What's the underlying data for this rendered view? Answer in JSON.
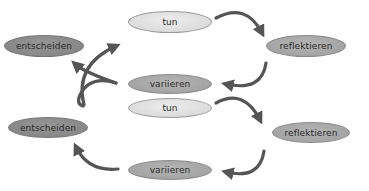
{
  "diagram": {
    "type": "cycle",
    "colors": {
      "light_node": "#dcdcdc",
      "mid_node": "#a4a4a4",
      "dark_node": "#888888",
      "arrow": "#555555"
    },
    "top": {
      "nodes": {
        "tun": "tun",
        "reflektieren": "reflektieren",
        "variieren": "variieren",
        "entscheiden": "entscheiden"
      },
      "edges": [
        {
          "from": "tun",
          "to": "reflektieren"
        },
        {
          "from": "reflektieren",
          "to": "variieren"
        },
        {
          "from": "variieren",
          "to": "entscheiden"
        },
        {
          "from": "entscheiden",
          "to": "tun"
        }
      ],
      "arrow_style": "crossed"
    },
    "bottom": {
      "nodes": {
        "tun": "tun",
        "reflektieren": "reflektieren",
        "variieren": "variieren",
        "entscheiden": "entscheiden"
      },
      "edges": [
        {
          "from": "tun",
          "to": "reflektieren"
        },
        {
          "from": "reflektieren",
          "to": "variieren"
        },
        {
          "from": "variieren",
          "to": "entscheiden"
        }
      ],
      "arrow_style": "open"
    }
  }
}
